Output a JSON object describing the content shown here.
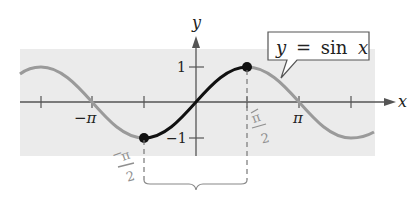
{
  "figure": {
    "type": "sine-graph-annotated",
    "function_label": "y = sin x",
    "callout": {
      "y": "y",
      "eq": "=",
      "fn": "sin",
      "x": "x"
    },
    "axes": {
      "x_label": "x",
      "y_label": "y"
    },
    "x_ticks": [
      {
        "value": "-3pi/2",
        "label": ""
      },
      {
        "value": "-pi",
        "label": "−π"
      },
      {
        "value": "-pi/2",
        "label": ""
      },
      {
        "value": "0",
        "label": ""
      },
      {
        "value": "pi/2",
        "label": ""
      },
      {
        "value": "pi",
        "label": "π"
      },
      {
        "value": "3pi/2",
        "label": ""
      }
    ],
    "y_ticks": [
      {
        "value": 1,
        "label": "1"
      },
      {
        "value": -1,
        "label": "−1"
      }
    ],
    "handwritten_labels": {
      "left": {
        "minus": "−",
        "num": "π",
        "den": "2"
      },
      "right": {
        "num": "π",
        "den": "2"
      }
    },
    "highlighted_interval": {
      "from": "-pi/2",
      "to": "pi/2",
      "endpoints": [
        "(-pi/2, -1)",
        "(pi/2, 1)"
      ]
    },
    "colors": {
      "background_band": "#ebebeb",
      "curve_gray": "#9a9a9a",
      "curve_highlight": "#111111",
      "axis": "#555555",
      "handwriting": "#8f8f8f"
    }
  }
}
